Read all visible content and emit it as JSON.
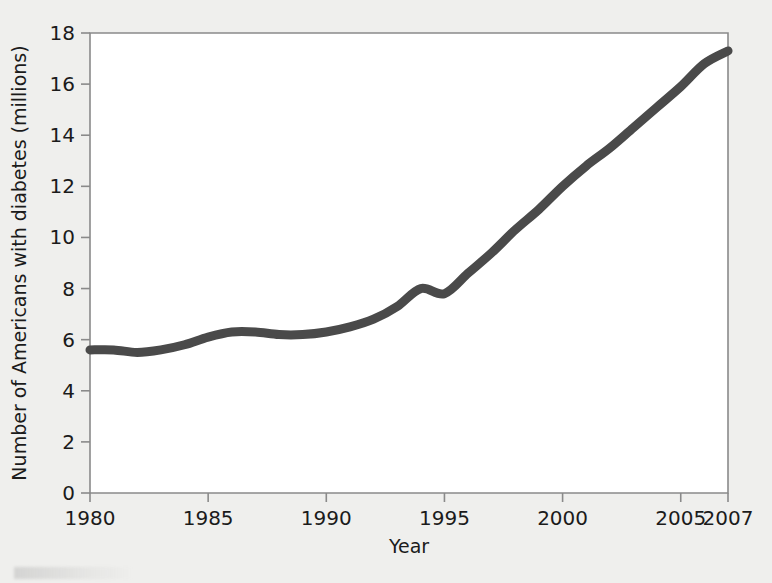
{
  "figure": {
    "background_color": "#efefed",
    "plot_background_color": "#ffffff",
    "frame_color": "#8a8a8a",
    "line_color": "#4a4a4a"
  },
  "chart_data": {
    "type": "line",
    "title": "",
    "xlabel": "Year",
    "ylabel": "Number of Americans with diabetes (millions)",
    "xlim": [
      1980,
      2007
    ],
    "ylim": [
      0,
      18
    ],
    "grid": false,
    "legend": "none",
    "xticks": [
      1980,
      1985,
      1990,
      1995,
      2000,
      2005,
      2007
    ],
    "xtick_labels": [
      "1980",
      "1985",
      "1990",
      "1995",
      "2000",
      "2005",
      "2007"
    ],
    "yticks": [
      0,
      2,
      4,
      6,
      8,
      10,
      12,
      14,
      16,
      18
    ],
    "ytick_labels": [
      "0",
      "2",
      "4",
      "6",
      "8",
      "10",
      "12",
      "14",
      "16",
      "18"
    ],
    "series": [
      {
        "name": "Number of Americans with diabetes (millions)",
        "x": [
          1980,
          1981,
          1982,
          1983,
          1984,
          1985,
          1986,
          1987,
          1988,
          1989,
          1990,
          1991,
          1992,
          1993,
          1994,
          1995,
          1996,
          1997,
          1998,
          1999,
          2000,
          2001,
          2002,
          2003,
          2004,
          2005,
          2006,
          2007
        ],
        "values": [
          5.6,
          5.6,
          5.5,
          5.6,
          5.8,
          6.1,
          6.3,
          6.3,
          6.2,
          6.2,
          6.3,
          6.5,
          6.8,
          7.3,
          8.0,
          7.8,
          8.6,
          9.4,
          10.3,
          11.1,
          12.0,
          12.8,
          13.5,
          14.3,
          15.1,
          15.9,
          16.8,
          17.3
        ]
      }
    ]
  }
}
